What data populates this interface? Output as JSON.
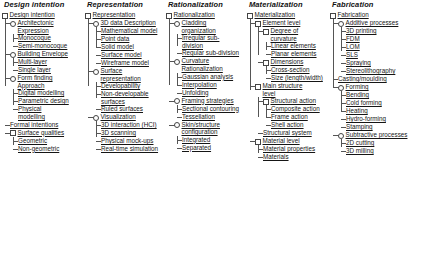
{
  "diagram": {
    "type": "hierarchical-tree-taxonomy",
    "column_count": 5,
    "columns": [
      {
        "title": "Design intention",
        "root": {
          "label": "Design intention",
          "marker": "box",
          "children": [
            {
              "label": "Architectonic Expression",
              "marker": "circle",
              "children": [
                {
                  "label": "Monocoque",
                  "marker": "none"
                },
                {
                  "label": "Semi-monocoque",
                  "marker": "none"
                }
              ]
            },
            {
              "label": "Building Envelope",
              "marker": "circle",
              "children": [
                {
                  "label": "Multi-layer",
                  "marker": "none"
                },
                {
                  "label": "Single layer",
                  "marker": "none"
                }
              ]
            },
            {
              "label": "Form finding Approach",
              "marker": "circle",
              "children": [
                {
                  "label": "Digital modelling",
                  "marker": "none"
                },
                {
                  "label": "Parametric design",
                  "marker": "none"
                },
                {
                  "label": "Physical modelling",
                  "marker": "none"
                }
              ]
            },
            {
              "label": "Formal intentions",
              "marker": "none"
            },
            {
              "label": "Surface qualities",
              "marker": "box",
              "children": [
                {
                  "label": "Geometric",
                  "marker": "none"
                },
                {
                  "label": "Non-geometric",
                  "marker": "none"
                }
              ]
            }
          ]
        }
      },
      {
        "title": "Representation",
        "root": {
          "label": "Representation",
          "marker": "box",
          "children": [
            {
              "label": "3D data Description",
              "marker": "circle",
              "children": [
                {
                  "label": "Mathematical model",
                  "marker": "none"
                },
                {
                  "label": "Point data",
                  "marker": "none"
                },
                {
                  "label": "Solid model",
                  "marker": "none"
                },
                {
                  "label": "Surface model",
                  "marker": "none"
                },
                {
                  "label": "Wireframe model",
                  "marker": "none"
                }
              ]
            },
            {
              "label": "Surface representation",
              "marker": "circle",
              "children": [
                {
                  "label": "Developability",
                  "marker": "none"
                },
                {
                  "label": "Non-developable surfaces",
                  "marker": "none"
                },
                {
                  "label": "Ruled surfaces",
                  "marker": "none"
                }
              ]
            },
            {
              "label": "Visualization",
              "marker": "circle",
              "children": [
                {
                  "label": "3D interaction (HCI)",
                  "marker": "none"
                },
                {
                  "label": "3D scanning",
                  "marker": "none"
                },
                {
                  "label": "Physical mock-ups",
                  "marker": "none"
                },
                {
                  "label": "Real-time simulation",
                  "marker": "none"
                }
              ]
            }
          ]
        }
      },
      {
        "title": "Rationalization",
        "root": {
          "label": "Rationalization",
          "marker": "box",
          "children": [
            {
              "label": "Cladding organization",
              "marker": "circle",
              "children": [
                {
                  "label": "Irregular sub-division",
                  "marker": "none"
                },
                {
                  "label": "Regular sub-division",
                  "marker": "none"
                }
              ]
            },
            {
              "label": "Curvature Rationalization",
              "marker": "circle",
              "children": [
                {
                  "label": "Gaussian analysis",
                  "marker": "none"
                },
                {
                  "label": "Interpolation",
                  "marker": "none"
                },
                {
                  "label": "Unfolding",
                  "marker": "none"
                }
              ]
            },
            {
              "label": "Framing strategies",
              "marker": "circle",
              "children": [
                {
                  "label": "Sectional contouring",
                  "marker": "none"
                },
                {
                  "label": "Tessellation",
                  "marker": "none"
                }
              ]
            },
            {
              "label": "Skin/structure configuration",
              "marker": "circle",
              "children": [
                {
                  "label": "Integrated",
                  "marker": "none"
                },
                {
                  "label": "Separated",
                  "marker": "none"
                }
              ]
            }
          ]
        }
      },
      {
        "title": "Materialization",
        "root": {
          "label": "Materialization",
          "marker": "box",
          "children": [
            {
              "label": "Element level",
              "marker": "box",
              "children": [
                {
                  "label": "Degree of curvature",
                  "marker": "box",
                  "children": [
                    {
                      "label": "Linear elements",
                      "marker": "none"
                    },
                    {
                      "label": "Planar elements",
                      "marker": "none"
                    }
                  ]
                },
                {
                  "label": "Dimensions",
                  "marker": "box",
                  "children": [
                    {
                      "label": "Cross-section",
                      "marker": "none"
                    },
                    {
                      "label": "Size (length/width)",
                      "marker": "none"
                    }
                  ]
                }
              ]
            },
            {
              "label": "Main structure level",
              "marker": "box",
              "children": [
                {
                  "label": "Structural action",
                  "marker": "box",
                  "children": [
                    {
                      "label": "Composite action",
                      "marker": "none"
                    },
                    {
                      "label": "Frame action",
                      "marker": "none"
                    },
                    {
                      "label": "Shell action",
                      "marker": "none"
                    }
                  ]
                },
                {
                  "label": "Structural system",
                  "marker": "none"
                }
              ]
            },
            {
              "label": "Material level",
              "marker": "box",
              "children": [
                {
                  "label": "Material properties",
                  "marker": "none"
                },
                {
                  "label": "Materials",
                  "marker": "none"
                }
              ]
            }
          ]
        }
      },
      {
        "title": "Fabrication",
        "root": {
          "label": "Fabrication",
          "marker": "box",
          "children": [
            {
              "label": "Additive processes",
              "marker": "circle",
              "children": [
                {
                  "label": "3D printing",
                  "marker": "none"
                },
                {
                  "label": "FDM",
                  "marker": "none"
                },
                {
                  "label": "LOM",
                  "marker": "none"
                },
                {
                  "label": "SLS",
                  "marker": "none"
                },
                {
                  "label": "Spraying",
                  "marker": "none"
                },
                {
                  "label": "Stereolithography",
                  "marker": "none"
                }
              ]
            },
            {
              "label": "Casting/moulding",
              "marker": "none"
            },
            {
              "label": "Forming",
              "marker": "circle",
              "children": [
                {
                  "label": "Bending",
                  "marker": "none"
                },
                {
                  "label": "Cold forming",
                  "marker": "none"
                },
                {
                  "label": "Heating",
                  "marker": "none"
                },
                {
                  "label": "Hydro-forming",
                  "marker": "none"
                },
                {
                  "label": "Stamping",
                  "marker": "none"
                }
              ]
            },
            {
              "label": "Subtractive processes",
              "marker": "circle",
              "children": [
                {
                  "label": "2D cutting",
                  "marker": "none"
                },
                {
                  "label": "3D milling",
                  "marker": "none"
                }
              ]
            }
          ]
        }
      }
    ]
  }
}
